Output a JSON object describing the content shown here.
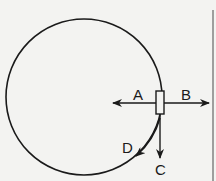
{
  "diagram": {
    "colors": {
      "ink": "#1a1a1a",
      "background": "#f3f3f1",
      "border": "#555555"
    },
    "circle": {
      "cx": 84,
      "cy": 97,
      "r": 78
    },
    "object": {
      "shape": "rectangle",
      "x": 156,
      "y": 91,
      "width": 8,
      "height": 23
    },
    "arrows": [
      {
        "id": "A",
        "label": "A",
        "direction": "left (toward center)"
      },
      {
        "id": "B",
        "label": "B",
        "direction": "right (away from center)"
      },
      {
        "id": "C",
        "label": "C",
        "direction": "down (tangential)"
      },
      {
        "id": "D",
        "label": "D",
        "direction": "along circular path"
      }
    ]
  }
}
